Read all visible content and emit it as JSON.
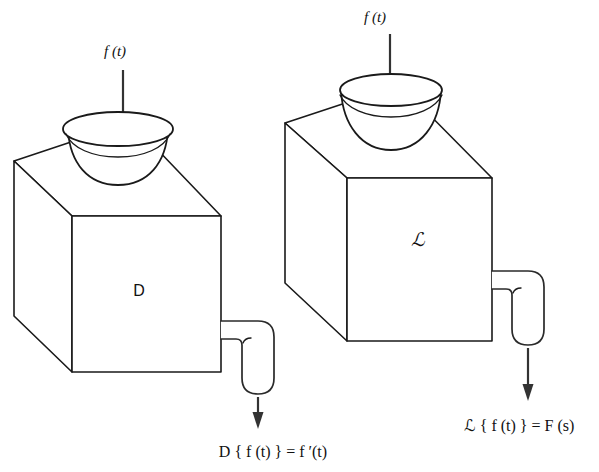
{
  "figure": {
    "background_color": "#ffffff",
    "line_color": "#1a1a1a",
    "arrow_color": "#333333",
    "width": 599,
    "height": 472
  },
  "panels": [
    {
      "id": "derivative-operator",
      "input_label": "f (t)",
      "box_label": "D",
      "box_label_kind": "upright",
      "output_caption": "D { f (t) } = f ′(t)",
      "output_caption_parts": {
        "operator": "D",
        "brace_open": "{",
        "argument": "f (t)",
        "brace_close": "}",
        "equals": "=",
        "result": "f ′(t)"
      }
    },
    {
      "id": "laplace-transform",
      "input_label": "f (t)",
      "box_label": "ℒ",
      "box_label_kind": "script",
      "output_caption": "ℒ { f (t) } = F (s)",
      "output_caption_parts": {
        "operator": "ℒ",
        "brace_open": "{",
        "argument": "f (t)",
        "brace_close": "}",
        "equals": "=",
        "result": "F (s)"
      }
    }
  ],
  "icon_names": {
    "input_arrow": "down-arrow-icon",
    "output_arrow": "down-arrow-icon",
    "funnel": "funnel-icon",
    "box": "cube-icon",
    "spout": "spout-pipe-icon"
  }
}
